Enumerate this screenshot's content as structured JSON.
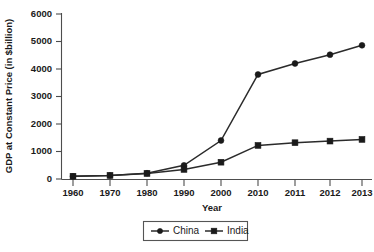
{
  "chart_data": {
    "type": "line",
    "title": "",
    "xlabel": "Year",
    "ylabel": "GDP at Constant Price (in $billion)",
    "categories": [
      "1960",
      "1970",
      "1980",
      "1990",
      "2000",
      "2010",
      "2011",
      "2012",
      "2013"
    ],
    "ylim": [
      0,
      6000
    ],
    "y_ticks": [
      "0",
      "1000",
      "2000",
      "3000",
      "4000",
      "5000",
      "6000"
    ],
    "y_tick_values": [
      0,
      1000,
      2000,
      3000,
      4000,
      5000,
      6000
    ],
    "grid": false,
    "legend_position": "bottom",
    "series": [
      {
        "name": "China",
        "marker": "circle",
        "color": "#1a1a1a",
        "values": [
          100,
          130,
          210,
          500,
          1400,
          3800,
          4200,
          4520,
          4860
        ]
      },
      {
        "name": "India",
        "marker": "square",
        "color": "#1a1a1a",
        "values": [
          100,
          130,
          200,
          350,
          610,
          1220,
          1320,
          1380,
          1440
        ]
      }
    ]
  },
  "legend": {
    "entries": [
      {
        "label": "China",
        "marker": "circle-marker-icon"
      },
      {
        "label": "India",
        "marker": "square-marker-icon"
      }
    ]
  },
  "axes": {
    "x_title": "Year",
    "y_title": "GDP at Constant Price (in $billion)"
  },
  "colors": {
    "line": "#2b2b2b",
    "marker": "#1a1a1a",
    "axis": "#4d4d4d",
    "text": "#1a1a1a",
    "background": "#ffffff"
  }
}
